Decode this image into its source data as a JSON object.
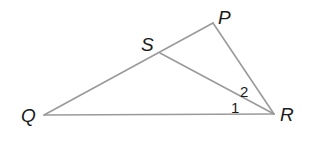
{
  "figure": {
    "type": "triangle-geometry",
    "line_color": "#9a9a9a",
    "label_color": "#1a1a1a",
    "vertices": {
      "P": {
        "label": "P",
        "x": 213,
        "y": 23,
        "label_x": 218,
        "label_y": 24
      },
      "Q": {
        "label": "Q",
        "x": 44,
        "y": 115,
        "label_x": 21,
        "label_y": 122
      },
      "R": {
        "label": "R",
        "x": 274,
        "y": 114,
        "label_x": 280,
        "label_y": 121
      },
      "S": {
        "label": "S",
        "x": 160,
        "y": 53,
        "label_x": 141,
        "label_y": 51
      }
    },
    "segments": [
      {
        "from": "Q",
        "to": "P",
        "name": "segment-qp"
      },
      {
        "from": "P",
        "to": "R",
        "name": "segment-pr"
      },
      {
        "from": "Q",
        "to": "R",
        "name": "segment-qr"
      },
      {
        "from": "S",
        "to": "R",
        "name": "segment-sr"
      }
    ],
    "angles": [
      {
        "label": "1",
        "x": 231,
        "y": 113
      },
      {
        "label": "2",
        "x": 240,
        "y": 97
      }
    ]
  }
}
